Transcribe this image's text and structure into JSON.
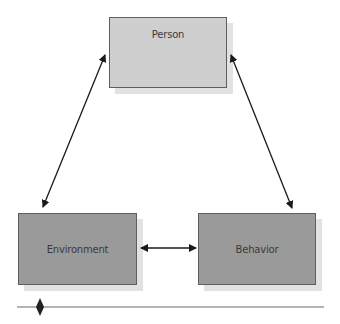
{
  "diagram": {
    "type": "triadic-reciprocal-model",
    "nodes": [
      {
        "id": "person",
        "label": "Person",
        "fill": "#cfcfcf"
      },
      {
        "id": "environment",
        "label": "Environment",
        "fill": "#9a9a9a"
      },
      {
        "id": "behavior",
        "label": "Behavior",
        "fill": "#9a9a9a"
      }
    ],
    "edges": [
      {
        "from": "person",
        "to": "environment",
        "direction": "bidirectional"
      },
      {
        "from": "person",
        "to": "behavior",
        "direction": "bidirectional"
      },
      {
        "from": "environment",
        "to": "behavior",
        "direction": "bidirectional"
      }
    ],
    "colors": {
      "arrow": "#1a1a1a",
      "border": "#5e5e5e",
      "shadow": "#e2e2e2",
      "rule": "#6a6a6a",
      "marker": "#222222"
    }
  }
}
